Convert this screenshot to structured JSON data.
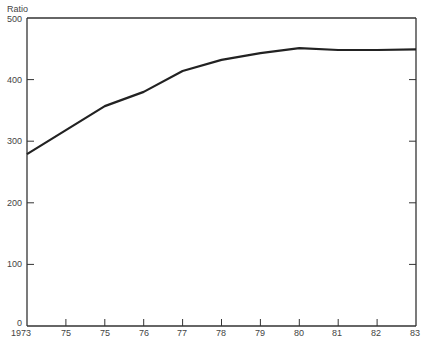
{
  "chart_data": {
    "type": "line",
    "title": "",
    "xlabel": "",
    "ylabel": "Ratio",
    "x": [
      "1973",
      "75",
      "75",
      "76",
      "77",
      "78",
      "79",
      "80",
      "81",
      "82",
      "83"
    ],
    "categories": [
      "1973",
      "75",
      "75",
      "76",
      "77",
      "78",
      "79",
      "80",
      "81",
      "82",
      "83"
    ],
    "values": [
      279,
      318,
      357,
      380,
      414,
      432,
      443,
      451,
      448,
      448,
      449
    ],
    "series": [
      {
        "name": "Ratio",
        "values": [
          279,
          318,
          357,
          380,
          414,
          432,
          443,
          451,
          448,
          448,
          449
        ]
      }
    ],
    "ylim": [
      0,
      500
    ],
    "yticks": [
      0,
      100,
      200,
      300,
      400,
      500
    ],
    "grid": false,
    "legend": null,
    "line_color": "#222222"
  },
  "axis": {
    "ylabel": "Ratio",
    "yticks": [
      "0",
      "100",
      "200",
      "300",
      "400",
      "500"
    ],
    "xticks": [
      "1973",
      "75",
      "75",
      "76",
      "77",
      "78",
      "79",
      "80",
      "81",
      "82",
      "83"
    ]
  }
}
